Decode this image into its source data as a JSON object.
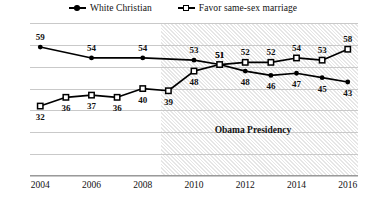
{
  "chart_data": {
    "type": "line",
    "title": "",
    "xlabel": "",
    "ylabel": "",
    "xlim": [
      2003.6,
      2016.4
    ],
    "ylim": [
      0,
      70
    ],
    "ytick_step": 10,
    "yticks": [
      "0",
      "10",
      "20",
      "30",
      "40",
      "50",
      "60",
      "70"
    ],
    "xticks": [
      "2004",
      "2006",
      "2008",
      "2010",
      "2012",
      "2014",
      "2016"
    ],
    "grid": "horizontal",
    "legend_position": "top-center",
    "series": [
      {
        "name": "White Christian",
        "marker": "filled-circle",
        "color": "#000000",
        "x": [
          2004,
          2006,
          2008,
          2010,
          2011,
          2012,
          2013,
          2014,
          2015,
          2016
        ],
        "values": [
          59,
          54,
          54,
          53,
          51,
          48,
          46,
          47,
          45,
          43
        ],
        "labels": [
          "59",
          "54",
          "54",
          "53",
          "51",
          "48",
          "46",
          "47",
          "45",
          "43"
        ]
      },
      {
        "name": "Favor same-sex marriage",
        "marker": "hollow-square",
        "color": "#000000",
        "x": [
          2004,
          2005,
          2006,
          2007,
          2008,
          2009,
          2010,
          2011,
          2012,
          2013,
          2014,
          2015,
          2016
        ],
        "values": [
          32,
          36,
          37,
          36,
          40,
          39,
          48,
          51,
          52,
          52,
          54,
          53,
          58
        ],
        "labels": [
          "32",
          "36",
          "37",
          "36",
          "40",
          "39",
          "48",
          "51",
          "52",
          "52",
          "54",
          "53",
          "58"
        ]
      }
    ],
    "annotations": [
      {
        "text": "Obama Presidency",
        "x": 2012.3,
        "y": 21
      }
    ],
    "shaded_region": {
      "label": "Obama Presidency",
      "x_start": 2008.7,
      "x_end": 2016.4,
      "color": "#e6e6e6"
    }
  },
  "legend": {
    "entries": [
      {
        "label": "White Christian",
        "marker": "filled-circle"
      },
      {
        "label": "Favor same-sex marriage",
        "marker": "hollow-square"
      }
    ]
  }
}
